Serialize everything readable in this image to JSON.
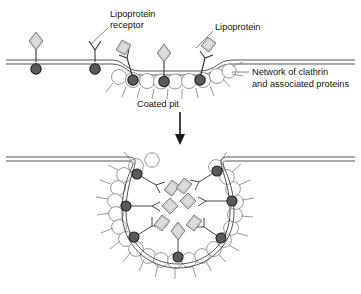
{
  "figure": {
    "title_visible": false,
    "type": "biology-process-diagram",
    "background_color": "#ffffff"
  },
  "labels": {
    "lipoprotein_receptor": {
      "line1": "Lipoprotein",
      "line2": "receptor"
    },
    "lipoprotein": {
      "line1": "Lipoprotein"
    },
    "clathrin_network": {
      "line1": "Network of clathrin",
      "line2": "and associated proteins"
    },
    "coated_pit": {
      "line1": "Coated pit"
    }
  },
  "colors": {
    "membrane_line": "#555555",
    "receptor_head_fill": "#5a5a5a",
    "receptor_head_stroke": "#1f1f1f",
    "lipoprotein_fill": "#c9c9c9",
    "lipoprotein_stroke": "#777777",
    "clathrin_stroke": "#8d8d8d",
    "text": "#111111",
    "arrow": "#1a1a1a",
    "leader": "#777777"
  },
  "panels": {
    "top": {
      "name": "flat-membrane-with-forming-coated-pit",
      "free_receptors": [
        {
          "id": "receptor-1",
          "x": 36,
          "occupied": true
        },
        {
          "id": "receptor-2",
          "x": 95,
          "occupied": false
        }
      ],
      "pit_receptors": [
        {
          "id": "pit-receptor-1",
          "x": 130,
          "occupied": true
        },
        {
          "id": "pit-receptor-2",
          "x": 163,
          "occupied": true
        },
        {
          "id": "pit-receptor-3",
          "x": 199,
          "occupied": true
        }
      ],
      "clathrin_circle_count": 9
    },
    "bottom": {
      "name": "deep-invaginated-coated-pit",
      "center_x": 178,
      "center_y": 218,
      "radius": 52,
      "receptor_count": 7,
      "lipoprotein_count": 7,
      "clathrin_circle_count": 22
    }
  },
  "arrow": {
    "name": "process-arrow-down",
    "direction": "down",
    "x": 180,
    "from_y": 112,
    "to_y": 143
  }
}
